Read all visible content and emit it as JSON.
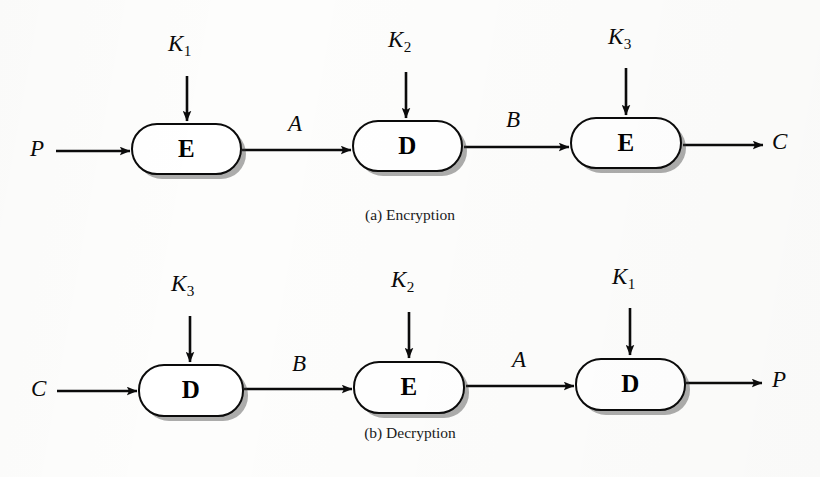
{
  "figure": {
    "background_color": "#fdfdfc",
    "ink_color": "#0b0b0b",
    "shadow_color": "#9a9a9a"
  },
  "panels": [
    {
      "id": "encryption",
      "caption": "(a) Encryption",
      "input_label": "P",
      "output_label": "C",
      "stages": [
        {
          "label": "E",
          "key": "K",
          "key_subscript": "1",
          "output_signal": "A"
        },
        {
          "label": "D",
          "key": "K",
          "key_subscript": "2",
          "output_signal": "B"
        },
        {
          "label": "E",
          "key": "K",
          "key_subscript": "3",
          "output_signal": "C"
        }
      ]
    },
    {
      "id": "decryption",
      "caption": "(b) Decryption",
      "input_label": "C",
      "output_label": "P",
      "stages": [
        {
          "label": "D",
          "key": "K",
          "key_subscript": "3",
          "output_signal": "B"
        },
        {
          "label": "E",
          "key": "K",
          "key_subscript": "2",
          "output_signal": "A"
        },
        {
          "label": "D",
          "key": "K",
          "key_subscript": "1",
          "output_signal": "P"
        }
      ]
    }
  ],
  "encryption": {
    "caption": "(a) Encryption",
    "input_label": "P",
    "output_label": "C",
    "box1_label": "E",
    "box2_label": "D",
    "box3_label": "E",
    "key1": "K",
    "key1_sub": "1",
    "key2": "K",
    "key2_sub": "2",
    "key3": "K",
    "key3_sub": "3",
    "signal_a": "A",
    "signal_b": "B"
  },
  "decryption": {
    "caption": "(b) Decryption",
    "input_label": "C",
    "output_label": "P",
    "box1_label": "D",
    "box2_label": "E",
    "box3_label": "D",
    "key1": "K",
    "key1_sub": "3",
    "key2": "K",
    "key2_sub": "2",
    "key3": "K",
    "key3_sub": "1",
    "signal_b": "B",
    "signal_a": "A"
  }
}
